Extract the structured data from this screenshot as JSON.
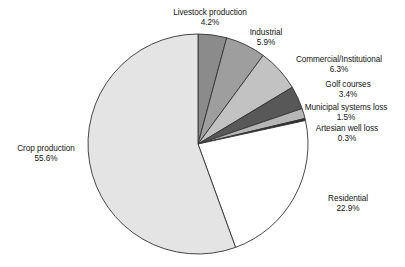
{
  "chart_data": {
    "type": "pie",
    "title": "",
    "subtitle": "",
    "xlabel": "",
    "ylabel": "",
    "legend_position": "none",
    "grid": false,
    "units": "percent",
    "start_angle_deg": 0,
    "direction": "clockwise",
    "categories": [
      "Livestock production",
      "Industrial",
      "Commercial/Institutional",
      "Golf courses",
      "Municipal systems loss",
      "Artesian well loss",
      "Residential",
      "Crop production"
    ],
    "values": [
      4.2,
      5.9,
      6.3,
      3.4,
      1.5,
      0.3,
      22.9,
      55.6
    ],
    "value_labels": [
      "4.2%",
      "5.9%",
      "6.3%",
      "3.4%",
      "1.5%",
      "0.3%",
      "22.9%",
      "55.6%"
    ],
    "colors": [
      "#8b8b8b",
      "#9e9e9e",
      "#c2c2c2",
      "#585858",
      "#b6b6b6",
      "#2b2b2b",
      "#ffffff",
      "#e4e4e4"
    ],
    "slices": [
      {
        "label": "Livestock production",
        "value": 4.2,
        "value_label": "4.2%",
        "color": "#8b8b8b"
      },
      {
        "label": "Industrial",
        "value": 5.9,
        "value_label": "5.9%",
        "color": "#9e9e9e"
      },
      {
        "label": "Commercial/Institutional",
        "value": 6.3,
        "value_label": "6.3%",
        "color": "#c2c2c2"
      },
      {
        "label": "Golf courses",
        "value": 3.4,
        "value_label": "3.4%",
        "color": "#585858"
      },
      {
        "label": "Municipal systems loss",
        "value": 1.5,
        "value_label": "1.5%",
        "color": "#b6b6b6"
      },
      {
        "label": "Artesian well loss",
        "value": 0.3,
        "value_label": "0.3%",
        "color": "#2b2b2b"
      },
      {
        "label": "Residential",
        "value": 22.9,
        "value_label": "22.9%",
        "color": "#ffffff"
      },
      {
        "label": "Crop production",
        "value": 55.6,
        "value_label": "55.6%",
        "color": "#e4e4e4"
      }
    ]
  },
  "geometry": {
    "center_x": 198,
    "center_y": 144,
    "radius": 110,
    "stroke": "#333333",
    "stroke_width": 0.9
  },
  "labels": {
    "livestock": {
      "name": "Livestock production",
      "value": "4.2%"
    },
    "industrial": {
      "name": "Industrial",
      "value": "5.9%"
    },
    "commercial": {
      "name": "Commercial/Institutional",
      "value": "6.3%"
    },
    "golf": {
      "name": "Golf courses",
      "value": "3.4%"
    },
    "municipal": {
      "name": "Municipal systems loss",
      "value": "1.5%"
    },
    "artesian": {
      "name": "Artesian well loss",
      "value": "0.3%"
    },
    "residential": {
      "name": "Residential",
      "value": "22.9%"
    },
    "crop": {
      "name": "Crop production",
      "value": "55.6%"
    }
  }
}
